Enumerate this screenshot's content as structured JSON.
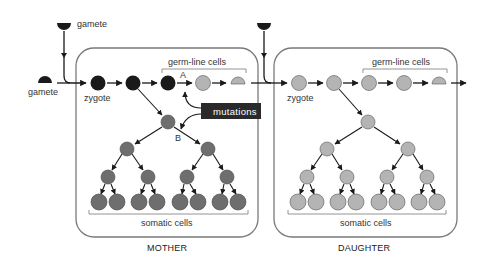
{
  "labels": {
    "gamete_top": "gamete",
    "gamete_left": "gamete",
    "zygote_mother": "zygote",
    "zygote_daughter": "zygote",
    "germline_mother": "germ-line cells",
    "germline_daughter": "germ-line cells",
    "somatic_mother": "somatic cells",
    "somatic_daughter": "somatic cells",
    "mutations": "mutations",
    "point_a": "A",
    "point_b": "B",
    "panel_mother": "MOTHER",
    "panel_daughter": "DAUGHTER"
  },
  "colors": {
    "mother_germline": "#1a1a1a",
    "mother_somatic": "#6e6e6e",
    "daughter_cell": "#b4b4b4",
    "mutation_box": "#2a2a2a",
    "outline": "#7a7a7a",
    "arrow": "#1a1a1a"
  }
}
